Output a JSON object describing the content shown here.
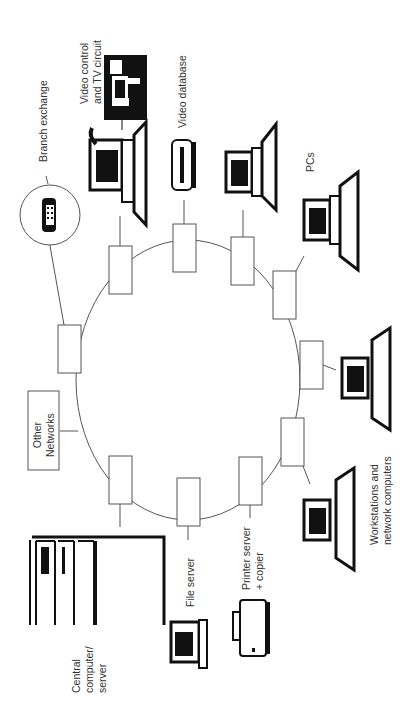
{
  "diagram": {
    "type": "ring-network",
    "orientation": "rotated-90-ccw",
    "labels": {
      "branch_exchange": "Branch exchange",
      "video_control": "Video control\nand TV circuit",
      "video_database": "Video database",
      "pcs": "PCs",
      "workstations": "Workstations and\nnetwork computers",
      "printer_server": "Printer server\n+ copier",
      "file_server": "File server",
      "central_computer": "Central\ncomputer/\nserver",
      "other_networks": "Other\nNetworks"
    },
    "nodes": [
      {
        "id": "branch-exchange",
        "label": "Branch exchange",
        "icon": "telephone-icon"
      },
      {
        "id": "video-control",
        "label": "Video control and TV circuit",
        "icon": "video-camera-icon"
      },
      {
        "id": "video-database",
        "label": "Video database",
        "icon": "video-disk-icon"
      },
      {
        "id": "pcs",
        "label": "PCs",
        "icon": "pc-icon"
      },
      {
        "id": "workstations",
        "label": "Workstations and network computers",
        "icon": "workstation-icon"
      },
      {
        "id": "printer-server",
        "label": "Printer server + copier",
        "icon": "printer-icon"
      },
      {
        "id": "file-server",
        "label": "File server",
        "icon": "pc-icon"
      },
      {
        "id": "central-computer",
        "label": "Central computer/server",
        "icon": "server-rack-icon"
      },
      {
        "id": "other-networks",
        "label": "Other Networks",
        "icon": "box"
      }
    ],
    "colors": {
      "line": "#555555",
      "ink": "#111111",
      "text": "#333333"
    }
  }
}
